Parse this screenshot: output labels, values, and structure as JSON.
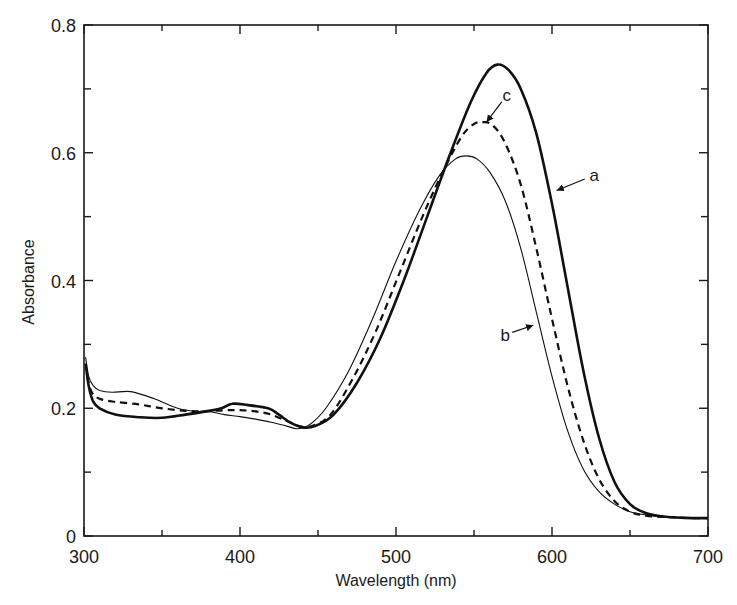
{
  "chart_data": {
    "type": "line",
    "title": "",
    "xlabel": "Wavelength (nm)",
    "ylabel": "Absorbance",
    "xlim": [
      300,
      700
    ],
    "ylim": [
      0,
      0.8
    ],
    "xticks_major": [
      300,
      400,
      500,
      600,
      700
    ],
    "xticks_minor": [
      350,
      450,
      550,
      650
    ],
    "yticks_major": [
      0,
      0.2,
      0.4,
      0.6,
      0.8
    ],
    "ytick_labels": [
      "0",
      "0.2",
      "0.4",
      "0.6",
      "0.8"
    ],
    "yticks_minor": [
      0.1,
      0.3,
      0.5,
      0.7
    ],
    "grid": false,
    "legend": "none (curves labeled a, b, c by annotations with arrows)",
    "series": [
      {
        "name": "a",
        "style": "thick solid",
        "x": [
          301,
          303,
          306,
          310,
          320,
          335,
          350,
          365,
          378,
          388,
          395,
          405,
          418,
          425,
          432,
          440,
          448,
          460,
          475,
          490,
          505,
          520,
          535,
          548,
          558,
          565,
          572,
          580,
          590,
          600,
          610,
          620,
          630,
          640,
          650,
          660,
          670,
          680,
          690,
          700
        ],
        "y": [
          0.27,
          0.235,
          0.21,
          0.2,
          0.19,
          0.186,
          0.185,
          0.19,
          0.195,
          0.2,
          0.207,
          0.205,
          0.2,
          0.19,
          0.178,
          0.17,
          0.172,
          0.19,
          0.24,
          0.31,
          0.4,
          0.5,
          0.6,
          0.68,
          0.725,
          0.738,
          0.73,
          0.7,
          0.63,
          0.52,
          0.39,
          0.26,
          0.155,
          0.085,
          0.05,
          0.036,
          0.031,
          0.029,
          0.028,
          0.028
        ]
      },
      {
        "name": "b",
        "style": "thin solid",
        "x": [
          301,
          303,
          306,
          310,
          318,
          330,
          345,
          360,
          372,
          380,
          390,
          400,
          410,
          420,
          430,
          437,
          445,
          455,
          470,
          485,
          500,
          515,
          528,
          538,
          545,
          552,
          560,
          570,
          580,
          590,
          600,
          610,
          620,
          630,
          640,
          650,
          660,
          670,
          680,
          690,
          700
        ],
        "y": [
          0.28,
          0.25,
          0.235,
          0.228,
          0.225,
          0.226,
          0.215,
          0.2,
          0.195,
          0.195,
          0.19,
          0.187,
          0.183,
          0.178,
          0.172,
          0.168,
          0.175,
          0.2,
          0.26,
          0.34,
          0.43,
          0.51,
          0.565,
          0.59,
          0.595,
          0.59,
          0.57,
          0.525,
          0.45,
          0.35,
          0.25,
          0.165,
          0.105,
          0.07,
          0.05,
          0.038,
          0.033,
          0.03,
          0.029,
          0.028,
          0.028
        ]
      },
      {
        "name": "c",
        "style": "dashed",
        "x": [
          302,
          305,
          310,
          320,
          335,
          350,
          365,
          378,
          390,
          400,
          410,
          420,
          430,
          438,
          446,
          458,
          472,
          487,
          502,
          517,
          530,
          542,
          550,
          556,
          562,
          570,
          580,
          590,
          600,
          610,
          620,
          630,
          640,
          650,
          660,
          670,
          680,
          690,
          700
        ],
        "y": [
          0.25,
          0.225,
          0.215,
          0.21,
          0.206,
          0.2,
          0.196,
          0.195,
          0.197,
          0.197,
          0.195,
          0.19,
          0.18,
          0.172,
          0.172,
          0.19,
          0.245,
          0.32,
          0.41,
          0.5,
          0.57,
          0.625,
          0.645,
          0.648,
          0.643,
          0.615,
          0.55,
          0.45,
          0.34,
          0.235,
          0.15,
          0.09,
          0.055,
          0.038,
          0.032,
          0.03,
          0.029,
          0.028,
          0.028
        ]
      }
    ],
    "annotations": [
      {
        "text": "a",
        "label_pos": [
          627,
          0.565
        ],
        "arrow_to": [
          603,
          0.541
        ]
      },
      {
        "text": "b",
        "label_pos": [
          570,
          0.315
        ],
        "arrow_to": [
          588,
          0.33
        ]
      },
      {
        "text": "c",
        "label_pos": [
          571,
          0.69
        ],
        "arrow_to": [
          558,
          0.648
        ]
      }
    ]
  }
}
